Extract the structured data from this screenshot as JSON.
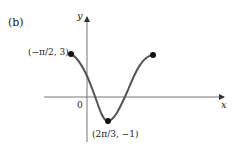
{
  "panel_label": "(b)",
  "axes": {
    "x_label": "x",
    "y_label": "y",
    "origin_label": "0"
  },
  "points": {
    "left": {
      "label": "(−π/2, 3)",
      "x": "−π/2",
      "y": "3"
    },
    "minimum": {
      "label": "(2π/3, −1)",
      "x": "2π/3",
      "y": "−1"
    }
  },
  "colors": {
    "curve": "#555555",
    "axis": "#777777",
    "point": "#111111"
  }
}
